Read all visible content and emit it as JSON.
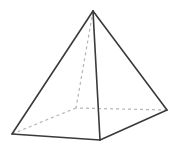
{
  "figure": {
    "name": "square-pyramid",
    "canvas": {
      "width": 175,
      "height": 146,
      "background_color": "#ffffff"
    },
    "style": {
      "visible_edge_color": "#3a3a3a",
      "visible_edge_width": 1.6,
      "hidden_edge_color": "#b5b5b5",
      "hidden_edge_width": 1.2,
      "hidden_edge_dash": "3 3",
      "face_color": "#ffffff"
    },
    "vertices": {
      "apex": {
        "label": "apex",
        "x": 93,
        "y": 11,
        "hidden": false
      },
      "base_front_left": {
        "label": "base-front-left",
        "x": 12,
        "y": 134,
        "hidden": false
      },
      "base_front": {
        "label": "base-front",
        "x": 100,
        "y": 140,
        "hidden": false
      },
      "base_right": {
        "label": "base-right",
        "x": 167,
        "y": 110,
        "hidden": false
      },
      "base_back": {
        "label": "base-back",
        "x": 76,
        "y": 108,
        "hidden": true
      }
    },
    "edges": [
      {
        "name": "apex-to-front-left",
        "from": "apex",
        "to": "base_front_left",
        "hidden": false
      },
      {
        "name": "apex-to-front",
        "from": "apex",
        "to": "base_front",
        "hidden": false
      },
      {
        "name": "apex-to-right",
        "from": "apex",
        "to": "base_right",
        "hidden": false
      },
      {
        "name": "apex-to-back",
        "from": "apex",
        "to": "base_back",
        "hidden": true
      },
      {
        "name": "base-front-left-to-front",
        "from": "base_front_left",
        "to": "base_front",
        "hidden": false
      },
      {
        "name": "base-front-to-right",
        "from": "base_front",
        "to": "base_right",
        "hidden": false
      },
      {
        "name": "base-right-to-back",
        "from": "base_right",
        "to": "base_back",
        "hidden": true
      },
      {
        "name": "base-back-to-front-left",
        "from": "base_back",
        "to": "base_front_left",
        "hidden": true
      }
    ],
    "paths": {
      "face_left": "M 93 11 L 12 134 L 100 140 Z",
      "face_right": "M 93 11 L 100 140 L 167 110 Z",
      "outline": "M 93 11 L 12 134 L 100 140 L 167 110 Z",
      "edge_apex_front_left": "M 93 11 L 12 134",
      "edge_apex_front": "M 93 11 L 100 140",
      "edge_apex_right": "M 93 11 L 167 110",
      "edge_apex_back": "M 93 11 L 76 108",
      "edge_base_fl_f": "M 12 134 L 100 140",
      "edge_base_f_r": "M 100 140 L 167 110",
      "edge_base_r_b": "M 167 110 L 76 108",
      "edge_base_b_fl": "M 76 108 L 12 134"
    }
  }
}
